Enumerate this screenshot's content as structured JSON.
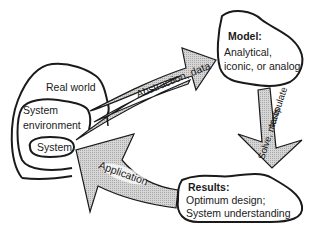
{
  "diagram": {
    "type": "process-cycle",
    "nodes": {
      "real_world": {
        "label": "Real world"
      },
      "system_environment": {
        "label_line1": "System",
        "label_line2": "environment"
      },
      "system": {
        "label": "System"
      },
      "model": {
        "title": "Model:",
        "line1": "Analytical,",
        "line2": "iconic, or analog"
      },
      "results": {
        "title": "Results:",
        "line1": "Optimum design;",
        "line2": "System understanding"
      }
    },
    "arrows": {
      "abstraction": {
        "label": "Abstraction, data",
        "from": "real world / system environment",
        "to": "model"
      },
      "solve": {
        "label_line1": "Solve, manipulate",
        "label_line2": "tests",
        "from": "model",
        "to": "results"
      },
      "application": {
        "label": "Application",
        "from": "results",
        "to": "system"
      }
    },
    "colors": {
      "stroke": "#1a1a1a",
      "arrow_fill": "#c9c9c9",
      "background": "#ffffff"
    }
  }
}
